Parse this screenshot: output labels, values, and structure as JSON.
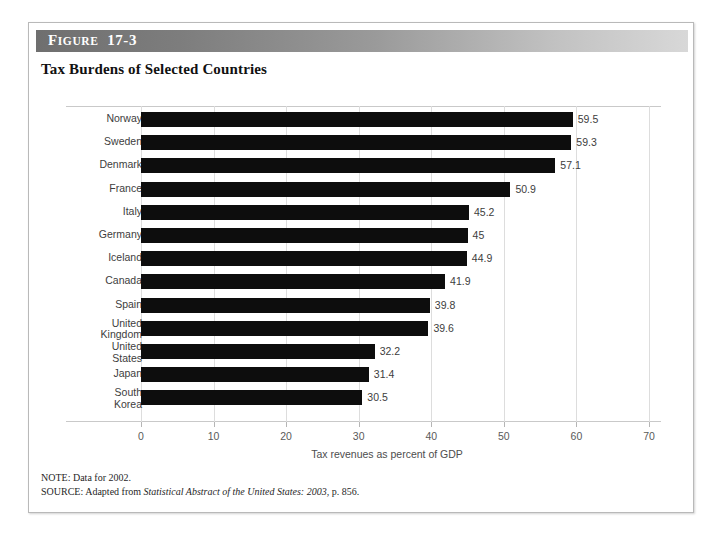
{
  "figure": {
    "label_prefix": "F",
    "label_small": "IGURE",
    "label_number": "17-3",
    "label_full": "FIGURE 17-3",
    "title": "Tax Burdens of Selected Countries"
  },
  "notes": {
    "note_label": "NOTE:",
    "note_text": "Data for 2002.",
    "note_line": "NOTE: Data for 2002.",
    "source_label": "SOURCE:",
    "source_prefix": "Adapted from",
    "source_italic": "Statistical Abstract of the United States: 2003",
    "source_suffix": ", p. 856.",
    "source_line": "SOURCE: Adapted from Statistical Abstract of the United States: 2003, p. 856."
  },
  "colors": {
    "bar": "#0d0d0d",
    "gridline": "#dddddd",
    "axis_line": "#c9c9c9",
    "header_dark": "#6f6f6f",
    "header_light": "#d8d8d8",
    "label_text": "#3d3d3d"
  },
  "chart_data": {
    "type": "bar",
    "orientation": "horizontal",
    "title": "Tax Burdens of Selected Countries",
    "xlabel": "Tax revenues as percent of GDP",
    "ylabel": "",
    "xlim": [
      0,
      70
    ],
    "xticks": [
      0,
      10,
      20,
      30,
      40,
      50,
      60,
      70
    ],
    "xtick_labels": [
      "0",
      "10",
      "20",
      "30",
      "40",
      "50",
      "60",
      "70"
    ],
    "grid": true,
    "grid_axis": "x",
    "legend": null,
    "categories": [
      "Norway",
      "Sweden",
      "Denmark",
      "France",
      "Italy",
      "Germany",
      "Iceland",
      "Canada",
      "Spain",
      "United\nKingdom",
      "United\nStates",
      "Japan",
      "South\nKorea"
    ],
    "values": [
      59.5,
      59.3,
      57.1,
      50.9,
      45.2,
      45,
      44.9,
      41.9,
      39.8,
      39.6,
      32.2,
      31.4,
      30.5
    ],
    "value_labels": [
      "59.5",
      "59.3",
      "57.1",
      "50.9",
      "45.2",
      "45",
      "44.9",
      "41.9",
      "39.8",
      "39.6",
      "32.2",
      "31.4",
      "30.5"
    ]
  }
}
